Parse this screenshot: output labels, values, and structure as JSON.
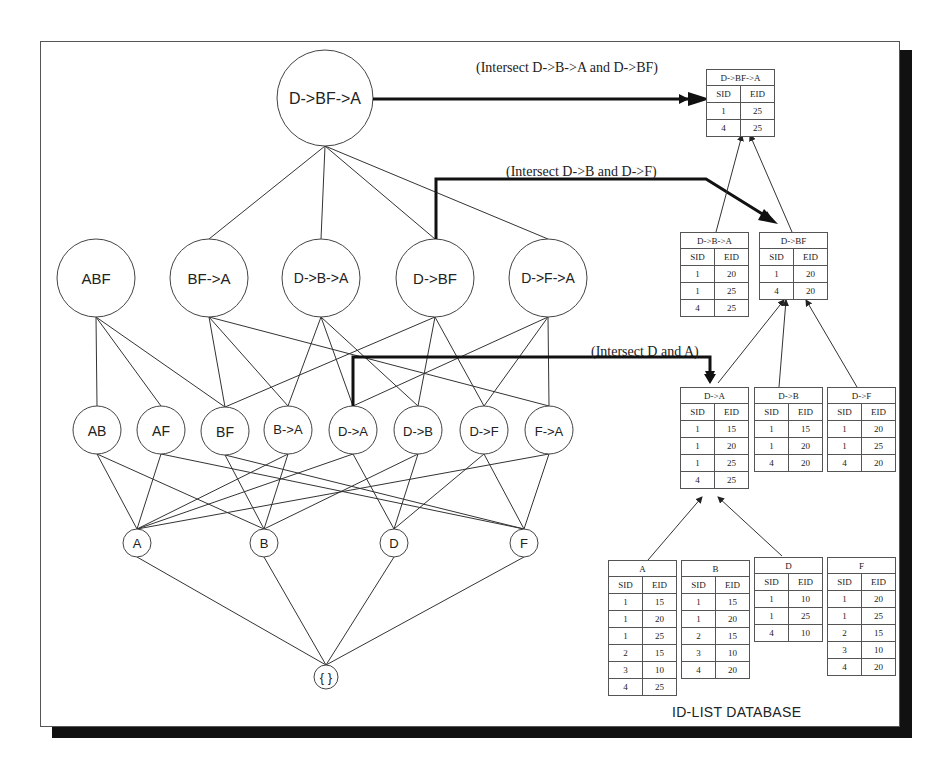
{
  "lattice": {
    "level4": [
      {
        "label": "D->BF->A",
        "x": 325,
        "y": 98,
        "r": 48
      }
    ],
    "level3": [
      {
        "label": "ABF",
        "x": 96,
        "y": 278,
        "r": 39
      },
      {
        "label": "BF->A",
        "x": 209,
        "y": 278,
        "r": 39
      },
      {
        "label": "D->B->A",
        "x": 321,
        "y": 278,
        "r": 39
      },
      {
        "label": "D->BF",
        "x": 435,
        "y": 278,
        "r": 39
      },
      {
        "label": "D->F->A",
        "x": 548,
        "y": 278,
        "r": 39
      }
    ],
    "level2": [
      {
        "label": "AB",
        "x": 97,
        "y": 430,
        "r": 24
      },
      {
        "label": "AF",
        "x": 161,
        "y": 430,
        "r": 24
      },
      {
        "label": "BF",
        "x": 225,
        "y": 431,
        "r": 24
      },
      {
        "label": "B->A",
        "x": 288,
        "y": 430,
        "r": 24
      },
      {
        "label": "D->A",
        "x": 353,
        "y": 430,
        "r": 24
      },
      {
        "label": "D->B",
        "x": 418,
        "y": 430,
        "r": 24
      },
      {
        "label": "D->F",
        "x": 484,
        "y": 430,
        "r": 24
      },
      {
        "label": "F->A",
        "x": 549,
        "y": 430,
        "r": 24
      }
    ],
    "level1": [
      {
        "label": "A",
        "x": 137,
        "y": 543,
        "r": 14
      },
      {
        "label": "B",
        "x": 264,
        "y": 543,
        "r": 14
      },
      {
        "label": "D",
        "x": 394,
        "y": 543,
        "r": 14
      },
      {
        "label": "F",
        "x": 524,
        "y": 543,
        "r": 14
      }
    ],
    "root": {
      "label": "{ }",
      "x": 326,
      "y": 677,
      "r": 12
    }
  },
  "annotations": [
    {
      "text": "(Intersect D->B->A and D->BF)",
      "x": 476,
      "y": 69
    },
    {
      "text": "(Intersect D->B and D->F)",
      "x": 506,
      "y": 173
    },
    {
      "text": "(Intersect D and A)",
      "x": 591,
      "y": 353
    }
  ],
  "id_lists": {
    "D->BF->A": {
      "title": "D->BF->A",
      "headers": [
        "SID",
        "EID"
      ],
      "rows": [
        [
          "1",
          "25"
        ],
        [
          "4",
          "25"
        ]
      ]
    },
    "D->B->A": {
      "title": "D->B->A",
      "headers": [
        "SID",
        "EID"
      ],
      "rows": [
        [
          "1",
          "20"
        ],
        [
          "1",
          "25"
        ],
        [
          "4",
          "25"
        ]
      ]
    },
    "D->BF": {
      "title": "D->BF",
      "headers": [
        "SID",
        "EID"
      ],
      "rows": [
        [
          "1",
          "20"
        ],
        [
          "4",
          "20"
        ]
      ]
    },
    "D->A": {
      "title": "D->A",
      "headers": [
        "SID",
        "EID"
      ],
      "rows": [
        [
          "1",
          "15"
        ],
        [
          "1",
          "20"
        ],
        [
          "1",
          "25"
        ],
        [
          "4",
          "25"
        ]
      ]
    },
    "D->B": {
      "title": "D->B",
      "headers": [
        "SID",
        "EID"
      ],
      "rows": [
        [
          "1",
          "15"
        ],
        [
          "1",
          "20"
        ],
        [
          "4",
          "20"
        ]
      ]
    },
    "D->F": {
      "title": "D->F",
      "headers": [
        "SID",
        "EID"
      ],
      "rows": [
        [
          "1",
          "20"
        ],
        [
          "1",
          "25"
        ],
        [
          "4",
          "20"
        ]
      ]
    },
    "A": {
      "title": "A",
      "headers": [
        "SID",
        "EID"
      ],
      "rows": [
        [
          "1",
          "15"
        ],
        [
          "1",
          "20"
        ],
        [
          "1",
          "25"
        ],
        [
          "2",
          "15"
        ],
        [
          "3",
          "10"
        ],
        [
          "4",
          "25"
        ]
      ]
    },
    "B": {
      "title": "B",
      "headers": [
        "SID",
        "EID"
      ],
      "rows": [
        [
          "1",
          "15"
        ],
        [
          "1",
          "20"
        ],
        [
          "2",
          "15"
        ],
        [
          "3",
          "10"
        ],
        [
          "4",
          "20"
        ]
      ]
    },
    "D": {
      "title": "D",
      "headers": [
        "SID",
        "EID"
      ],
      "rows": [
        [
          "1",
          "10"
        ],
        [
          "1",
          "25"
        ],
        [
          "4",
          "10"
        ]
      ]
    },
    "F": {
      "title": "F",
      "headers": [
        "SID",
        "EID"
      ],
      "rows": [
        [
          "1",
          "20"
        ],
        [
          "1",
          "25"
        ],
        [
          "2",
          "15"
        ],
        [
          "3",
          "10"
        ],
        [
          "4",
          "20"
        ]
      ]
    }
  },
  "database_title": "ID-LIST DATABASE"
}
